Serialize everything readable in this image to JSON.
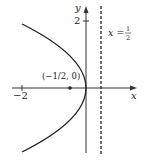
{
  "diagram": {
    "equation_implied": "y^2 = -2x",
    "axes": {
      "x_label": "x",
      "y_label": "y",
      "x_tick_label": "−2",
      "y_tick_label": "2"
    },
    "focus": {
      "label": "(−1/2, 0)",
      "x": -0.5,
      "y": 0
    },
    "directrix": {
      "label_lhs": "x =",
      "label_num": "1",
      "label_den": "2",
      "x": 0.5
    },
    "vertex": {
      "x": 0,
      "y": 0
    },
    "colors": {
      "curve": "#222222",
      "axis": "#333333",
      "background": "#ffffff"
    }
  }
}
